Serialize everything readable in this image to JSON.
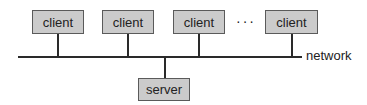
{
  "diagram": {
    "type": "client-server network topology",
    "clients": [
      {
        "label": "client"
      },
      {
        "label": "client"
      },
      {
        "label": "client"
      },
      {
        "label": "client"
      }
    ],
    "ellipsis": "···",
    "network_label": "network",
    "server": {
      "label": "server"
    },
    "colors": {
      "box_fill": "#cbcbcb",
      "box_border": "#5a5a5a",
      "line": "#2a2a2a",
      "text": "#222222"
    }
  }
}
